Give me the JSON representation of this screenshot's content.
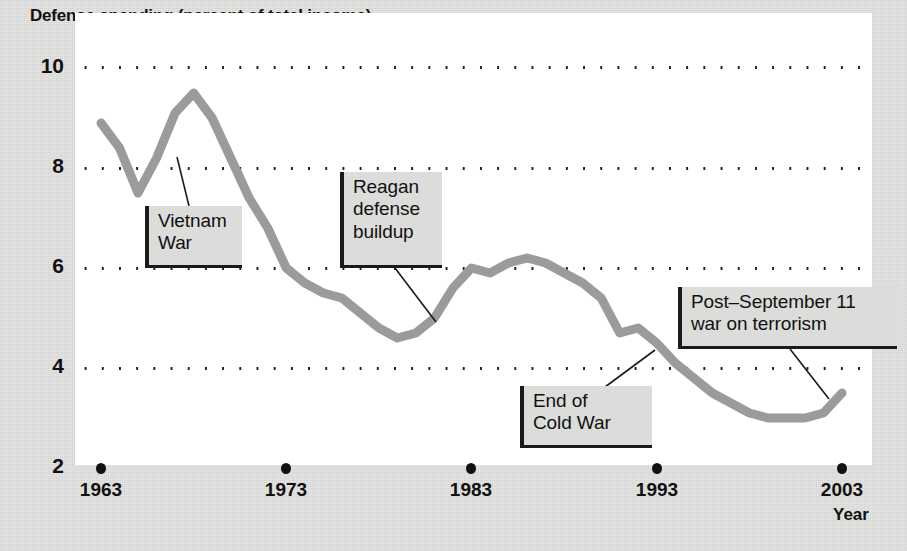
{
  "chart_data": {
    "type": "line",
    "title": "Defense spending (percent of total income)",
    "xlabel": "Year",
    "ylabel": "",
    "xlim": [
      1963,
      2003
    ],
    "ylim": [
      2,
      10
    ],
    "grid": true,
    "legend": "none",
    "line_color": "#9b9b9b",
    "xticks": [
      "1963",
      "1973",
      "1983",
      "1993",
      "2003"
    ],
    "yticks": [
      "10",
      "8",
      "6",
      "4",
      "2"
    ],
    "x": [
      1963,
      1964,
      1965,
      1966,
      1967,
      1968,
      1969,
      1970,
      1971,
      1972,
      1973,
      1974,
      1975,
      1976,
      1977,
      1978,
      1979,
      1980,
      1981,
      1982,
      1983,
      1984,
      1985,
      1986,
      1987,
      1988,
      1989,
      1990,
      1991,
      1992,
      1993,
      1994,
      1995,
      1996,
      1997,
      1998,
      1999,
      2000,
      2001,
      2002,
      2003
    ],
    "values": [
      8.9,
      8.4,
      7.5,
      8.2,
      9.1,
      9.5,
      9.0,
      8.2,
      7.4,
      6.8,
      6.0,
      5.7,
      5.5,
      5.4,
      5.1,
      4.8,
      4.6,
      4.7,
      5.0,
      5.6,
      6.0,
      5.9,
      6.1,
      6.2,
      6.1,
      5.9,
      5.7,
      5.4,
      4.7,
      4.8,
      4.5,
      4.1,
      3.8,
      3.5,
      3.3,
      3.1,
      3.0,
      3.0,
      3.0,
      3.1,
      3.5
    ],
    "annotations": [
      {
        "id": "vietnam-war",
        "text": "Vietnam\nWar",
        "points_to_year": 1966,
        "points_to_value": 8.2
      },
      {
        "id": "reagan-defense-buildup",
        "text": "Reagan\ndefense\nbuildup",
        "points_to_year": 1981,
        "points_to_value": 5.0
      },
      {
        "id": "end-of-cold-war",
        "text": "End of\nCold War",
        "points_to_year": 1992,
        "points_to_value": 4.8
      },
      {
        "id": "post-september-11-war-on-terrorism",
        "text": "Post–September 11\nwar on terrorism",
        "points_to_year": 2002,
        "points_to_value": 3.1
      }
    ]
  }
}
